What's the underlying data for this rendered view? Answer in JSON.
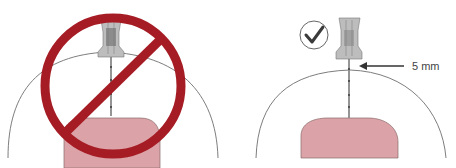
{
  "diagram": {
    "left_panel": {
      "meaning": "incorrect",
      "symbol": "prohibition-sign",
      "description": "Needle too long, penetrates through skin into muscle"
    },
    "right_panel": {
      "meaning": "correct",
      "symbol": "check-mark",
      "description": "Short needle stays in subcutaneous fat layer",
      "annotation": "5 mm"
    },
    "colors": {
      "prohibition_red": "#a61c24",
      "muscle_pink": "#dba3a8",
      "muscle_outline": "#8a6a6a",
      "skin_outline": "#6e6e6e",
      "needle_gray": "#8a8a8a",
      "hub_gray": "#9a9a9a",
      "check_dark": "#3a3a3a"
    }
  }
}
